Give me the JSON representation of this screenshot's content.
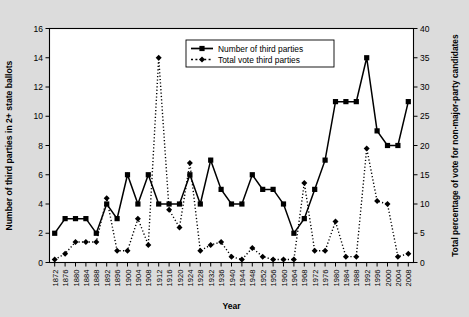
{
  "figure": {
    "background_color": "#dcdcdc",
    "plot_background_color": "#ffffff",
    "axis_color": "#000000"
  },
  "axes": {
    "x_label": "Year",
    "y_left_label": "Number of third parties in 2+ state ballots",
    "y_right_label": "Total percentage of vote for non-major-party candidates",
    "x_ticks": [
      "1872",
      "1876",
      "1880",
      "1884",
      "1888",
      "1892",
      "1896",
      "1900",
      "1904",
      "1908",
      "1912",
      "1916",
      "1920",
      "1924",
      "1928",
      "1932",
      "1936",
      "1940",
      "1944",
      "1948",
      "1952",
      "1956",
      "1960",
      "1964",
      "1968",
      "1972",
      "1976",
      "1980",
      "1984",
      "1988",
      "1992",
      "1996",
      "2000",
      "2004",
      "2008"
    ],
    "y_left_ticks": [
      "0",
      "2",
      "4",
      "6",
      "8",
      "10",
      "12",
      "14",
      "16"
    ],
    "y_right_ticks": [
      "0",
      "5",
      "10",
      "15",
      "20",
      "25",
      "30",
      "35",
      "40"
    ]
  },
  "legend": {
    "position": "top-center-right",
    "entries": [
      {
        "label": "Number of third parties",
        "style": "solid",
        "marker": "square"
      },
      {
        "label": "Total vote third parties",
        "style": "dashed",
        "marker": "diamond"
      }
    ]
  },
  "chart_data": {
    "type": "line",
    "title": "",
    "xlabel": "Year",
    "ylabel": "Number of third parties in 2+ state ballots",
    "y2label": "Total percentage of vote for non-major-party candidates",
    "ylim": [
      0,
      16
    ],
    "y2lim": [
      0,
      40
    ],
    "grid": false,
    "legend": "upper center",
    "x": [
      1872,
      1876,
      1880,
      1884,
      1888,
      1892,
      1896,
      1900,
      1904,
      1908,
      1912,
      1916,
      1920,
      1924,
      1928,
      1932,
      1936,
      1940,
      1944,
      1948,
      1952,
      1956,
      1960,
      1964,
      1968,
      1972,
      1976,
      1980,
      1984,
      1988,
      1992,
      1996,
      2000,
      2004,
      2008
    ],
    "series": [
      {
        "name": "Number of third parties",
        "axis": "left",
        "style": "solid",
        "marker": "square",
        "values": [
          2,
          3,
          3,
          3,
          2,
          4,
          3,
          6,
          4,
          6,
          4,
          4,
          4,
          6,
          4,
          7,
          5,
          4,
          4,
          6,
          5,
          5,
          4,
          2,
          3,
          5,
          7,
          11,
          11,
          11,
          14,
          9,
          8,
          8,
          11
        ]
      },
      {
        "name": "Total vote third parties",
        "axis": "right",
        "style": "dashed",
        "marker": "diamond",
        "values": [
          0.5,
          1.5,
          3.5,
          3.5,
          3.5,
          11,
          2,
          2,
          7.5,
          3,
          35,
          9,
          6,
          17,
          2,
          3,
          3.5,
          1,
          0.5,
          2.5,
          1,
          0.5,
          0.5,
          0.5,
          13.6,
          2,
          2,
          7,
          1,
          1,
          19.5,
          10.5,
          10,
          1,
          1.5
        ]
      }
    ]
  }
}
